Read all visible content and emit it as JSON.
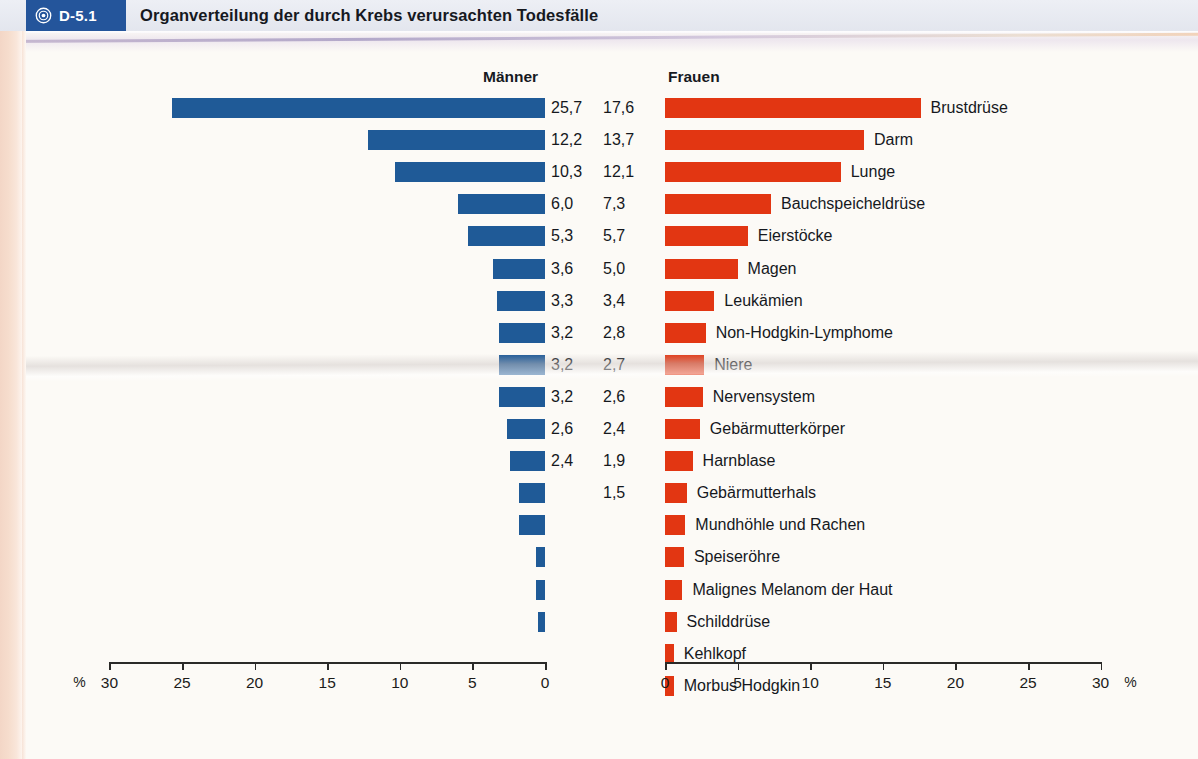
{
  "header": {
    "badge_code": "D-5.1",
    "badge_icon": "bullseye-icon",
    "title": "Organverteilung der durch Krebs verursachten Todesfälle",
    "badge_bg": "#24559b",
    "bar_bg": "#e6e9f1"
  },
  "chart_data": {
    "type": "bar",
    "orientation": "horizontal",
    "title": "Organverteilung der durch Krebs verursachten Todesfälle",
    "xlabel": "%",
    "ylabel": "",
    "xlim": [
      0,
      32
    ],
    "grid": false,
    "legend": "none",
    "axis_ticks": [
      0,
      5,
      10,
      15,
      20,
      25,
      30
    ],
    "axis_unit": "%",
    "left_axis_ticks": [
      "%",
      "30",
      "25",
      "20",
      "15",
      "10",
      "5",
      "0"
    ],
    "right_axis_ticks": [
      "0",
      "5",
      "10",
      "15",
      "20",
      "25",
      "30",
      "%"
    ],
    "series": [
      {
        "name": "Männer",
        "color": "#1f5a97",
        "direction": "left",
        "categories": [
          "Lunge",
          "Darm",
          "Prostata",
          "Bauchspeicheldrüse",
          "Magen",
          "Niere",
          "Leukämien",
          "Speiseröhre",
          "Mundhöhle und Rachen",
          "Harnblase",
          "Nervensystem",
          "Non-Hodgkin-Lymphome",
          "Kehlkopf",
          "Malignes Melanom der Haut",
          "Schilddrüse",
          "Morbus Hodgkin",
          "Hoden"
        ],
        "values": [
          25.7,
          12.2,
          10.3,
          6.0,
          5.3,
          3.6,
          3.3,
          3.2,
          3.2,
          3.2,
          2.6,
          2.4,
          1.8,
          1.8,
          0.6,
          0.6,
          0.5
        ],
        "value_labels": [
          "25,7",
          "12,2",
          "10,3",
          "6,0",
          "5,3",
          "3,6",
          "3,3",
          "3,2",
          "3,2",
          "3,2",
          "2,6",
          "2,4",
          "",
          "",
          "",
          "",
          ""
        ]
      },
      {
        "name": "Frauen",
        "color": "#e23612",
        "direction": "right",
        "categories": [
          "Brustdrüse",
          "Darm",
          "Lunge",
          "Bauchspeicheldrüse",
          "Eierstöcke",
          "Magen",
          "Leukämien",
          "Non-Hodgkin-Lymphome",
          "Niere",
          "Nervensystem",
          "Gebärmutterkörper",
          "Harnblase",
          "Gebärmutterhals",
          "Mundhöhle und Rachen",
          "Speiseröhre",
          "Malignes Melanom der Haut",
          "Schilddrüse",
          "Kehlkopf",
          "Morbus Hodgkin"
        ],
        "values": [
          17.6,
          13.7,
          12.1,
          7.3,
          5.7,
          5.0,
          3.4,
          2.8,
          2.7,
          2.6,
          2.4,
          1.9,
          1.5,
          1.4,
          1.3,
          1.2,
          0.8,
          0.6,
          0.6
        ],
        "value_labels": [
          "17,6",
          "13,7",
          "12,1",
          "7,3",
          "5,7",
          "5,0",
          "3,4",
          "2,8",
          "2,7",
          "2,6",
          "2,4",
          "1,9",
          "1,5",
          "",
          "",
          "",
          "",
          "",
          ""
        ]
      }
    ]
  }
}
